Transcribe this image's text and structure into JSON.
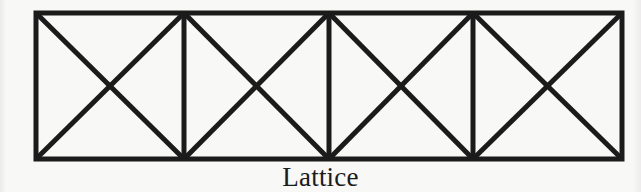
{
  "figure": {
    "caption": "Lattice",
    "kind": "truss-diagram",
    "background_color": "#f8f8f7",
    "line_color": "#1b1b1b",
    "frame": {
      "left": 36,
      "top": 12,
      "right": 622,
      "bottom": 161,
      "chord_thickness": 5
    },
    "panels": [
      {
        "index": 1,
        "x_start": 36,
        "x_end": 184,
        "bracing": "x-brace"
      },
      {
        "index": 2,
        "x_start": 184,
        "x_end": 329,
        "bracing": "x-brace"
      },
      {
        "index": 3,
        "x_start": 329,
        "x_end": 473,
        "bracing": "x-brace"
      },
      {
        "index": 4,
        "x_start": 473,
        "x_end": 622,
        "bracing": "x-brace"
      }
    ],
    "verticals": [
      {
        "name": "left-post",
        "x": 36
      },
      {
        "name": "post-1",
        "x": 184
      },
      {
        "name": "center-post",
        "x": 329
      },
      {
        "name": "post-3",
        "x": 473
      },
      {
        "name": "right-post",
        "x": 622
      }
    ],
    "chords": [
      {
        "name": "top-chord",
        "y": 13
      },
      {
        "name": "bottom-chord",
        "y": 159
      }
    ],
    "diagonals": [
      {
        "panel": 1,
        "direction": "down-right",
        "x1": 36,
        "y1": 13,
        "x2": 184,
        "y2": 159
      },
      {
        "panel": 1,
        "direction": "up-right",
        "x1": 36,
        "y1": 159,
        "x2": 184,
        "y2": 13
      },
      {
        "panel": 2,
        "direction": "down-right",
        "x1": 184,
        "y1": 13,
        "x2": 329,
        "y2": 159
      },
      {
        "panel": 2,
        "direction": "up-right",
        "x1": 184,
        "y1": 159,
        "x2": 329,
        "y2": 13
      },
      {
        "panel": 3,
        "direction": "down-right",
        "x1": 329,
        "y1": 13,
        "x2": 473,
        "y2": 159
      },
      {
        "panel": 3,
        "direction": "up-right",
        "x1": 329,
        "y1": 159,
        "x2": 473,
        "y2": 13
      },
      {
        "panel": 4,
        "direction": "down-right",
        "x1": 473,
        "y1": 13,
        "x2": 622,
        "y2": 159
      },
      {
        "panel": 4,
        "direction": "up-right",
        "x1": 473,
        "y1": 159,
        "x2": 622,
        "y2": 13
      }
    ]
  }
}
